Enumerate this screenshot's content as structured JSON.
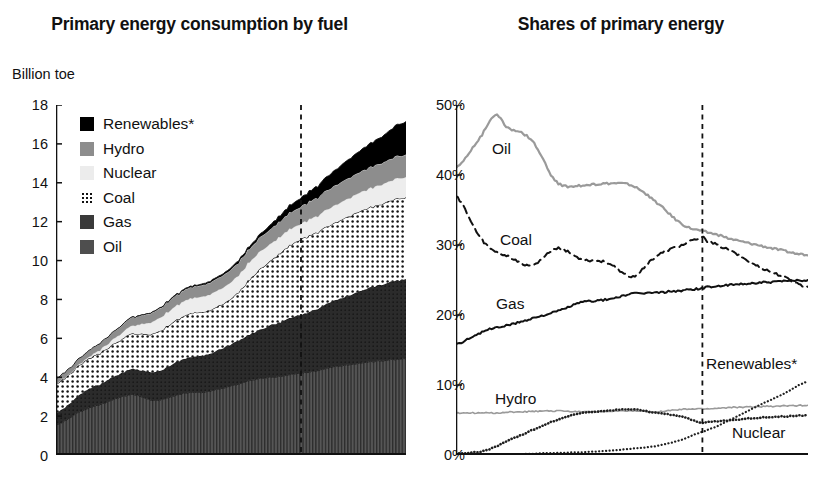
{
  "figure": {
    "background": "#ffffff",
    "panels": [
      "Primary energy consumption by fuel",
      "Shares of primary energy"
    ]
  },
  "left": {
    "title": "Primary energy consumption by fuel",
    "unit_label": "Billion toe",
    "legend": [
      {
        "label": "Renewables*",
        "swatch": "renewables-swatch",
        "color": "#000000"
      },
      {
        "label": "Hydro",
        "swatch": "hydro-swatch",
        "color": "#8d8d8d"
      },
      {
        "label": "Nuclear",
        "swatch": "nuclear-swatch",
        "color": "#ececec"
      },
      {
        "label": "Coal",
        "swatch": "coal-swatch",
        "color": "#ffffff"
      },
      {
        "label": "Gas",
        "swatch": "gas-swatch",
        "color": "#3a3a3a"
      },
      {
        "label": "Oil",
        "swatch": "oil-swatch",
        "color": "#4e4e4e"
      }
    ],
    "yticks": [
      "18",
      "16",
      "14",
      "12",
      "10",
      "8",
      "6",
      "4",
      "2",
      "0"
    ],
    "xticks": [
      "1965",
      "1975",
      "1985",
      "1995",
      "2005",
      "2015",
      "2025",
      "2035"
    ],
    "forecast_divider_year": 2014
  },
  "right": {
    "title": "Shares of primary energy",
    "yticks": [
      "50%",
      "40%",
      "30%",
      "20%",
      "10%",
      "0%"
    ],
    "xticks": [
      "1965",
      "1975",
      "1985",
      "1995",
      "2005",
      "2015",
      "2025",
      "2035"
    ],
    "series_labels": [
      {
        "name": "Oil",
        "text": "Oil"
      },
      {
        "name": "Coal",
        "text": "Coal"
      },
      {
        "name": "Gas",
        "text": "Gas"
      },
      {
        "name": "Hydro",
        "text": "Hydro"
      },
      {
        "name": "Renewables",
        "text": "Renewables*"
      },
      {
        "name": "Nuclear",
        "text": "Nuclear"
      }
    ],
    "forecast_divider_year": 2014
  },
  "chart_data": [
    {
      "id": "primary-energy-consumption-by-fuel",
      "type": "area",
      "stacked": true,
      "title": "Primary energy consumption by fuel",
      "xlabel": "",
      "ylabel": "Billion toe",
      "unit": "Billion toe",
      "xlim": [
        1965,
        2035
      ],
      "ylim": [
        0,
        18
      ],
      "ytick_values": [
        0,
        2,
        4,
        6,
        8,
        10,
        12,
        14,
        16,
        18
      ],
      "xtick_values": [
        1965,
        1975,
        1985,
        1995,
        2005,
        2015,
        2025,
        2035
      ],
      "grid": false,
      "legend_position": "inside-top-left",
      "annotations": [
        {
          "type": "vertical-dashed-line",
          "x": 2014,
          "note": "history / forecast divider"
        }
      ],
      "x": [
        1965,
        1970,
        1975,
        1980,
        1985,
        1990,
        1995,
        2000,
        2005,
        2010,
        2014,
        2015,
        2020,
        2025,
        2030,
        2035
      ],
      "series": [
        {
          "name": "Oil",
          "color": "#4e4e4e",
          "pattern": "vertical-hatch",
          "values": [
            1.55,
            2.25,
            2.7,
            3.1,
            2.8,
            3.15,
            3.25,
            3.55,
            3.9,
            4.05,
            4.2,
            4.25,
            4.5,
            4.7,
            4.85,
            4.95
          ]
        },
        {
          "name": "Gas",
          "color": "#2e2e2e",
          "pattern": "solid",
          "values": [
            0.6,
            0.9,
            1.1,
            1.3,
            1.45,
            1.75,
            1.9,
            2.15,
            2.45,
            2.8,
            3.0,
            3.05,
            3.35,
            3.65,
            3.9,
            4.1
          ]
        },
        {
          "name": "Coal",
          "color": "#ffffff",
          "pattern": "dotted-stipple",
          "values": [
            1.5,
            1.55,
            1.65,
            1.8,
            2.0,
            2.2,
            2.25,
            2.35,
            3.0,
            3.55,
            3.9,
            3.9,
            4.0,
            4.1,
            4.15,
            4.2
          ]
        },
        {
          "name": "Nuclear",
          "color": "#ececec",
          "pattern": "solid",
          "values": [
            0.02,
            0.05,
            0.2,
            0.4,
            0.65,
            0.75,
            0.8,
            0.85,
            0.9,
            0.85,
            0.8,
            0.82,
            0.88,
            0.95,
            1.0,
            1.05
          ]
        },
        {
          "name": "Hydro",
          "color": "#8d8d8d",
          "pattern": "solid",
          "values": [
            0.25,
            0.3,
            0.35,
            0.42,
            0.48,
            0.55,
            0.6,
            0.65,
            0.7,
            0.8,
            0.88,
            0.9,
            1.0,
            1.05,
            1.1,
            1.15
          ]
        },
        {
          "name": "Renewables*",
          "color": "#000000",
          "pattern": "solid",
          "values": [
            0.0,
            0.0,
            0.01,
            0.02,
            0.03,
            0.05,
            0.07,
            0.1,
            0.15,
            0.3,
            0.45,
            0.5,
            0.75,
            1.05,
            1.35,
            1.7
          ]
        }
      ],
      "totals": [
        3.92,
        5.05,
        6.01,
        7.04,
        7.41,
        8.45,
        8.87,
        9.65,
        11.1,
        12.35,
        13.23,
        13.42,
        14.48,
        15.5,
        16.35,
        17.15
      ]
    },
    {
      "id": "shares-of-primary-energy",
      "type": "line",
      "title": "Shares of primary energy",
      "xlabel": "",
      "ylabel": "",
      "unit": "percent",
      "xlim": [
        1965,
        2035
      ],
      "ylim": [
        0,
        50
      ],
      "ytick_values": [
        0,
        10,
        20,
        30,
        40,
        50
      ],
      "ytick_labels": [
        "0%",
        "10%",
        "20%",
        "30%",
        "40%",
        "50%"
      ],
      "xtick_values": [
        1965,
        1975,
        1985,
        1995,
        2005,
        2015,
        2025,
        2035
      ],
      "grid": false,
      "legend_position": "inline-labels",
      "annotations": [
        {
          "type": "vertical-dashed-line",
          "x": 2014,
          "note": "history / forecast divider"
        }
      ],
      "x": [
        1965,
        1970,
        1973,
        1975,
        1980,
        1985,
        1990,
        1995,
        2000,
        2005,
        2010,
        2014,
        2015,
        2020,
        2025,
        2030,
        2035
      ],
      "series": [
        {
          "name": "Oil",
          "color": "#9a9a9a",
          "style": "solid",
          "width": 2.2,
          "values": [
            41.0,
            45.5,
            48.5,
            46.8,
            45.0,
            39.0,
            38.5,
            38.8,
            38.5,
            36.0,
            33.0,
            32.0,
            31.8,
            30.8,
            30.0,
            29.2,
            28.5
          ]
        },
        {
          "name": "Coal",
          "color": "#111111",
          "style": "dashed",
          "width": 2.0,
          "values": [
            37.0,
            31.0,
            29.0,
            28.5,
            27.0,
            29.5,
            28.0,
            27.5,
            25.5,
            28.5,
            30.0,
            31.0,
            30.5,
            29.0,
            27.0,
            25.5,
            24.0
          ]
        },
        {
          "name": "Gas",
          "color": "#111111",
          "style": "solid",
          "width": 2.0,
          "values": [
            15.8,
            17.5,
            18.2,
            18.5,
            19.5,
            20.5,
            21.8,
            22.2,
            23.0,
            23.2,
            23.5,
            23.8,
            24.0,
            24.3,
            24.6,
            24.8,
            25.0
          ]
        },
        {
          "name": "Hydro",
          "color": "#9a9a9a",
          "style": "solid",
          "width": 1.6,
          "values": [
            6.0,
            6.0,
            6.0,
            6.1,
            6.2,
            6.3,
            6.2,
            6.2,
            6.3,
            6.2,
            6.5,
            6.6,
            6.6,
            6.8,
            6.9,
            7.0,
            7.1
          ]
        },
        {
          "name": "Nuclear",
          "color": "#1f1f1f",
          "style": "dotted-thick",
          "width": 2.6,
          "values": [
            0.2,
            0.5,
            1.2,
            2.0,
            3.5,
            5.0,
            6.0,
            6.3,
            6.5,
            6.0,
            5.5,
            4.6,
            4.7,
            5.0,
            5.3,
            5.5,
            5.7
          ]
        },
        {
          "name": "Renewables*",
          "color": "#1f1f1f",
          "style": "dotted-fine",
          "width": 2.2,
          "values": [
            0.1,
            0.1,
            0.1,
            0.1,
            0.2,
            0.3,
            0.4,
            0.6,
            0.9,
            1.3,
            2.2,
            3.3,
            3.6,
            5.2,
            7.0,
            8.7,
            10.5
          ]
        }
      ]
    }
  ]
}
